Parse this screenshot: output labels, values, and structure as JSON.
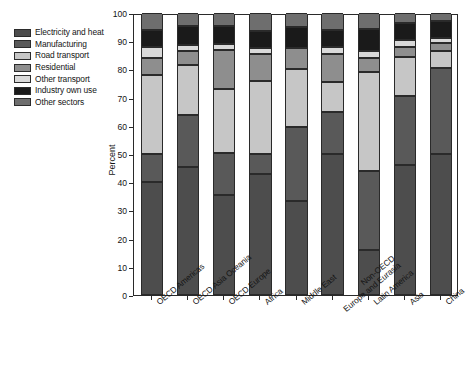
{
  "chart_data": {
    "type": "bar",
    "subtype": "stacked-bar-100-percent",
    "title": "",
    "xlabel": "",
    "ylabel": "Percent",
    "ylim": [
      0,
      100
    ],
    "yticks": [
      0,
      10,
      20,
      30,
      40,
      50,
      60,
      70,
      80,
      90,
      100
    ],
    "grid": false,
    "legend_position": "upper-left-outside",
    "categories": [
      "OECD Americas",
      "OECD Asia Oceania",
      "OECD Europe",
      "Africa",
      "Middle East",
      "Non-OECD Europe and Eurasia",
      "Latin America",
      "Asia",
      "China"
    ],
    "category_lines": [
      [
        "OECD Americas"
      ],
      [
        "OECD Asia Oceania"
      ],
      [
        "OECD Europe"
      ],
      [
        "Africa"
      ],
      [
        "Middle East"
      ],
      [
        "Non-OECD",
        "Europe and Eurasia"
      ],
      [
        "Latin America"
      ],
      [
        "Asia"
      ],
      [
        "China"
      ]
    ],
    "series": [
      {
        "name": "Electricity and heat",
        "color": "#4d4d4d",
        "values": [
          40.0,
          45.5,
          35.5,
          43.0,
          33.5,
          50.0,
          16.0,
          46.0,
          50.0
        ]
      },
      {
        "name": "Manufacturing",
        "color": "#595959",
        "values": [
          10.0,
          18.5,
          15.0,
          7.0,
          26.0,
          15.0,
          28.0,
          24.5,
          30.5
        ]
      },
      {
        "name": "Road transport",
        "color": "#c6c6c6",
        "values": [
          28.0,
          17.5,
          22.5,
          26.0,
          20.5,
          10.5,
          35.0,
          14.0,
          6.0
        ]
      },
      {
        "name": "Residential",
        "color": "#8e8e8e",
        "values": [
          6.0,
          5.0,
          14.0,
          9.5,
          7.5,
          10.0,
          5.0,
          3.5,
          3.0
        ]
      },
      {
        "name": "Other transport",
        "color": "#d9d9d9",
        "values": [
          4.0,
          2.0,
          2.0,
          2.0,
          0.0,
          2.5,
          2.5,
          2.5,
          1.5
        ]
      },
      {
        "name": "Industry own use",
        "color": "#1a1a1a",
        "values": [
          6.0,
          7.0,
          6.5,
          6.0,
          7.5,
          6.0,
          8.0,
          6.0,
          6.0
        ]
      },
      {
        "name": "Other sectors",
        "color": "#6e6e6e",
        "values": [
          6.0,
          4.5,
          4.5,
          6.5,
          5.0,
          6.0,
          5.5,
          3.5,
          3.0
        ]
      }
    ]
  },
  "axes": {
    "ylabel": "Percent"
  },
  "caption": ""
}
